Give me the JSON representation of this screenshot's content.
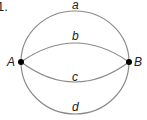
{
  "problem_number": "1.",
  "points": {
    "A": {
      "label": "A"
    },
    "B": {
      "label": "B"
    }
  },
  "curves": {
    "a": {
      "label": "a"
    },
    "b": {
      "label": "b"
    },
    "c": {
      "label": "c"
    },
    "d": {
      "label": "d"
    }
  },
  "colors": {
    "curve": "#8a8a8a",
    "point": "#000000",
    "text": "#222222"
  }
}
